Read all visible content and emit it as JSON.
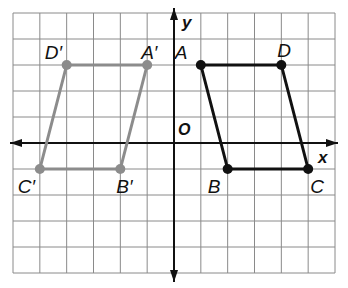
{
  "diagram": {
    "type": "coordinate-plane-reflection",
    "grid": {
      "cols": 12,
      "rows": 10,
      "x_min": -6,
      "x_max": 6,
      "y_min": -5,
      "y_max": 5,
      "color": "#8a8a8a"
    },
    "axes": {
      "x_label": "x",
      "y_label": "y",
      "origin_label": "O",
      "color": "#111111"
    },
    "original": {
      "name": "ABCD",
      "color": "#111111",
      "vertices": [
        {
          "label": "A",
          "x": 1,
          "y": 3
        },
        {
          "label": "D",
          "x": 4,
          "y": 3
        },
        {
          "label": "C",
          "x": 5,
          "y": -1
        },
        {
          "label": "B",
          "x": 2,
          "y": -1
        }
      ]
    },
    "image": {
      "name": "A'B'C'D'",
      "color": "#8c8c8c",
      "vertices": [
        {
          "label": "A′",
          "x": -1,
          "y": 3
        },
        {
          "label": "D′",
          "x": -4,
          "y": 3
        },
        {
          "label": "C′",
          "x": -5,
          "y": -1
        },
        {
          "label": "B′",
          "x": -2,
          "y": -1
        }
      ]
    }
  }
}
